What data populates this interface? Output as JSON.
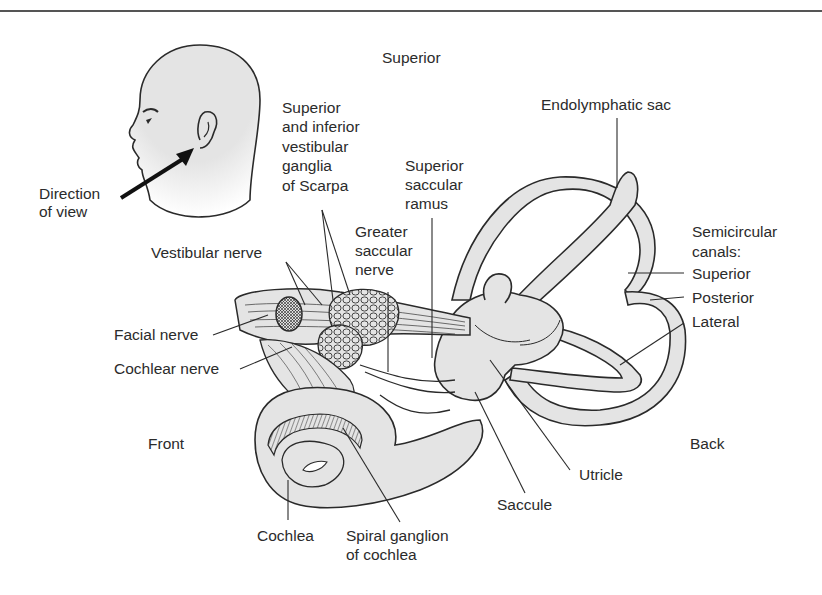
{
  "figure": {
    "orientation": {
      "superior": "Superior",
      "front": "Front",
      "back": "Back"
    },
    "inset": {
      "direction_label_line1": "Direction",
      "direction_label_line2": "of view"
    },
    "labels": {
      "scarpa_1": "Superior",
      "scarpa_2": "and inferior",
      "scarpa_3": "vestibular",
      "scarpa_4": "ganglia",
      "scarpa_5": "of Scarpa",
      "superior_saccular_1": "Superior",
      "superior_saccular_2": "saccular",
      "superior_saccular_3": "ramus",
      "greater_saccular_1": "Greater",
      "greater_saccular_2": "saccular",
      "greater_saccular_3": "nerve",
      "vestibular_nerve": "Vestibular nerve",
      "facial_nerve": "Facial nerve",
      "cochlear_nerve": "Cochlear nerve",
      "endolymphatic_sac": "Endolymphatic sac",
      "semicircular_1": "Semicircular",
      "semicircular_2": "canals:",
      "canal_superior": "Superior",
      "canal_posterior": "Posterior",
      "canal_lateral": "Lateral",
      "utricle": "Utricle",
      "saccule": "Saccule",
      "cochlea": "Cochlea",
      "spiral_ganglion_1": "Spiral ganglion",
      "spiral_ganglion_2": "of cochlea"
    },
    "colors": {
      "fill": "#e4e4e4",
      "stroke": "#2a2a2a",
      "text": "#2b2b2b"
    }
  }
}
